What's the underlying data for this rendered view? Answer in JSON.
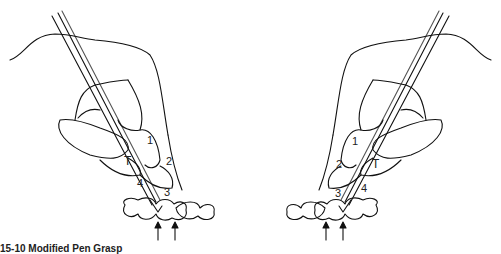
{
  "figure": {
    "left_panel": {
      "labels": {
        "finger1": "1",
        "finger2": "2",
        "finger3": "3",
        "finger4": "4",
        "thumb": "T"
      }
    },
    "right_panel": {
      "labels": {
        "finger1": "1",
        "finger2": "2",
        "finger3": "3",
        "finger4": "4",
        "thumb": "T"
      }
    },
    "caption": "15-10 Modified Pen Grasp"
  }
}
